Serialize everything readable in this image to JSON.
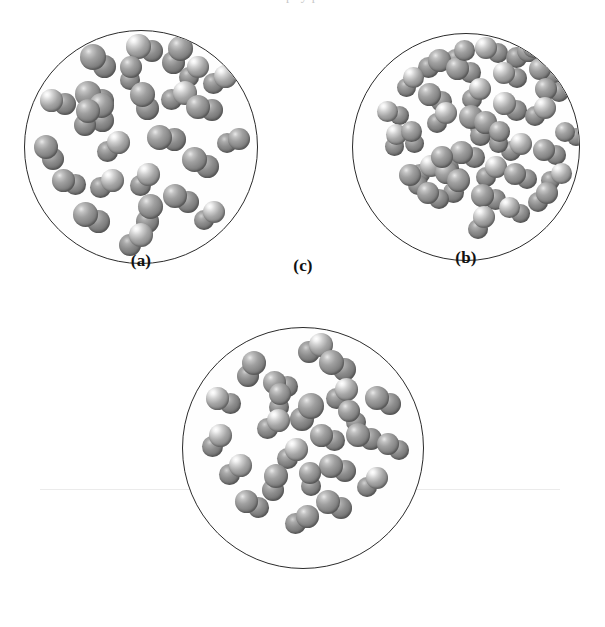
{
  "figure": {
    "background_color": "#ffffff",
    "outline_color": "#2b2b2b",
    "particle_color": "#8a8a8a",
    "particle_highlight_color": "#ffffff",
    "page_bleed_text": "p. y p"
  },
  "panels": [
    {
      "id": "panel-a",
      "label": "(a)",
      "molecule_count": 26,
      "geometry": {
        "cx": 141,
        "cy": 147,
        "r": 117
      },
      "label_pos": {
        "x": 141,
        "y": 281
      },
      "molecules": [
        {
          "x": 0.515,
          "y": 0.075,
          "a": 18,
          "r1": 12.5,
          "r2": 11.0,
          "hl": 1
        },
        {
          "x": 0.315,
          "y": 0.13,
          "a": 40,
          "r1": 13.0,
          "r2": 11.5,
          "hl": 0
        },
        {
          "x": 0.65,
          "y": 0.105,
          "a": 115,
          "r1": 12.5,
          "r2": 11.5,
          "hl": 0
        },
        {
          "x": 0.832,
          "y": 0.21,
          "a": 150,
          "r1": 11.5,
          "r2": 10.5,
          "hl": 1
        },
        {
          "x": 0.142,
          "y": 0.305,
          "a": 12,
          "r1": 11.5,
          "r2": 11.0,
          "hl": 1
        },
        {
          "x": 0.3,
          "y": 0.285,
          "a": 28,
          "r1": 13.0,
          "r2": 12.0,
          "hl": 0
        },
        {
          "x": 0.33,
          "y": 0.35,
          "a": 85,
          "r1": 12.5,
          "r2": 11.5,
          "hl": 0
        },
        {
          "x": 0.512,
          "y": 0.3,
          "a": 70,
          "r1": 12.5,
          "r2": 11.5,
          "hl": 0
        },
        {
          "x": 0.655,
          "y": 0.278,
          "a": 155,
          "r1": 12.0,
          "r2": 10.5,
          "hl": 1
        },
        {
          "x": 0.77,
          "y": 0.33,
          "a": 12,
          "r1": 12.0,
          "r2": 11.0,
          "hl": 0
        },
        {
          "x": 0.608,
          "y": 0.46,
          "a": 8,
          "r1": 12.5,
          "r2": 11.5,
          "hl": 0
        },
        {
          "x": 0.375,
          "y": 0.495,
          "a": 142,
          "r1": 11.5,
          "r2": 10.5,
          "hl": 1
        },
        {
          "x": 0.105,
          "y": 0.52,
          "a": 58,
          "r1": 12.0,
          "r2": 11.0,
          "hl": 0
        },
        {
          "x": 0.888,
          "y": 0.47,
          "a": 165,
          "r1": 11.0,
          "r2": 10.0,
          "hl": 0
        },
        {
          "x": 0.752,
          "y": 0.565,
          "a": 28,
          "r1": 12.5,
          "r2": 11.5,
          "hl": 0
        },
        {
          "x": 0.19,
          "y": 0.648,
          "a": 20,
          "r1": 11.5,
          "r2": 10.5,
          "hl": 0
        },
        {
          "x": 0.348,
          "y": 0.655,
          "a": 150,
          "r1": 11.5,
          "r2": 10.5,
          "hl": 1
        },
        {
          "x": 0.51,
          "y": 0.638,
          "a": 128,
          "r1": 11.5,
          "r2": 10.5,
          "hl": 1
        },
        {
          "x": 0.668,
          "y": 0.718,
          "a": 25,
          "r1": 12.0,
          "r2": 11.0,
          "hl": 0
        },
        {
          "x": 0.785,
          "y": 0.79,
          "a": 140,
          "r1": 11.0,
          "r2": 10.0,
          "hl": 1
        },
        {
          "x": 0.53,
          "y": 0.782,
          "a": 105,
          "r1": 12.5,
          "r2": 11.5,
          "hl": 0
        },
        {
          "x": 0.285,
          "y": 0.8,
          "a": 28,
          "r1": 12.5,
          "r2": 11.5,
          "hl": 0
        },
        {
          "x": 0.472,
          "y": 0.892,
          "a": 138,
          "r1": 12.0,
          "r2": 11.0,
          "hl": 1
        },
        {
          "x": 0.262,
          "y": 0.372,
          "a": 100,
          "r1": 12.0,
          "r2": 11.0,
          "hl": 0
        },
        {
          "x": 0.452,
          "y": 0.18,
          "a": 95,
          "r1": 11.0,
          "r2": 10.0,
          "hl": 0
        },
        {
          "x": 0.72,
          "y": 0.175,
          "a": 135,
          "r1": 11.0,
          "r2": 10.0,
          "hl": 1
        }
      ]
    },
    {
      "id": "panel-b",
      "label": "(b)",
      "molecule_count": 38,
      "geometry": {
        "cx": 466,
        "cy": 147,
        "r": 114
      },
      "label_pos": {
        "x": 466,
        "y": 281
      },
      "molecules": [
        {
          "x": 0.608,
          "y": 0.072,
          "a": 20,
          "r1": 11.0,
          "r2": 10.0,
          "hl": 1
        },
        {
          "x": 0.745,
          "y": 0.088,
          "a": 150,
          "r1": 11.5,
          "r2": 10.5,
          "hl": 0
        },
        {
          "x": 0.355,
          "y": 0.13,
          "a": 150,
          "r1": 11.5,
          "r2": 10.5,
          "hl": 0
        },
        {
          "x": 0.485,
          "y": 0.16,
          "a": 15,
          "r1": 11.5,
          "r2": 10.5,
          "hl": 0
        },
        {
          "x": 0.69,
          "y": 0.182,
          "a": 18,
          "r1": 11.0,
          "r2": 10.0,
          "hl": 1
        },
        {
          "x": 0.845,
          "y": 0.165,
          "a": 28,
          "r1": 11.0,
          "r2": 10.0,
          "hl": 0
        },
        {
          "x": 0.25,
          "y": 0.212,
          "a": 128,
          "r1": 10.5,
          "r2": 9.5,
          "hl": 1
        },
        {
          "x": 0.875,
          "y": 0.248,
          "a": 15,
          "r1": 11.0,
          "r2": 10.0,
          "hl": 0
        },
        {
          "x": 0.36,
          "y": 0.28,
          "a": 30,
          "r1": 11.5,
          "r2": 10.5,
          "hl": 0
        },
        {
          "x": 0.54,
          "y": 0.265,
          "a": 130,
          "r1": 11.0,
          "r2": 10.0,
          "hl": 1
        },
        {
          "x": 0.69,
          "y": 0.32,
          "a": 28,
          "r1": 11.5,
          "r2": 10.5,
          "hl": 1
        },
        {
          "x": 0.82,
          "y": 0.342,
          "a": 145,
          "r1": 11.0,
          "r2": 10.0,
          "hl": 1
        },
        {
          "x": 0.178,
          "y": 0.35,
          "a": 18,
          "r1": 10.5,
          "r2": 9.5,
          "hl": 1
        },
        {
          "x": 0.388,
          "y": 0.368,
          "a": 135,
          "r1": 11.0,
          "r2": 10.0,
          "hl": 1
        },
        {
          "x": 0.54,
          "y": 0.385,
          "a": 42,
          "r1": 12.0,
          "r2": 11.0,
          "hl": 0
        },
        {
          "x": 0.57,
          "y": 0.418,
          "a": 110,
          "r1": 11.5,
          "r2": 10.5,
          "hl": 0
        },
        {
          "x": 0.188,
          "y": 0.468,
          "a": 100,
          "r1": 10.5,
          "r2": 9.5,
          "hl": 1
        },
        {
          "x": 0.715,
          "y": 0.498,
          "a": 145,
          "r1": 11.0,
          "r2": 10.0,
          "hl": 1
        },
        {
          "x": 0.955,
          "y": 0.44,
          "a": 25,
          "r1": 10.0,
          "r2": 9.0,
          "hl": 0
        },
        {
          "x": 0.862,
          "y": 0.518,
          "a": 22,
          "r1": 11.0,
          "r2": 10.0,
          "hl": 0
        },
        {
          "x": 0.505,
          "y": 0.53,
          "a": 20,
          "r1": 11.5,
          "r2": 10.5,
          "hl": 0
        },
        {
          "x": 0.318,
          "y": 0.598,
          "a": 142,
          "r1": 11.0,
          "r2": 10.0,
          "hl": 1
        },
        {
          "x": 0.435,
          "y": 0.62,
          "a": 25,
          "r1": 11.5,
          "r2": 10.5,
          "hl": 0
        },
        {
          "x": 0.452,
          "y": 0.668,
          "a": 115,
          "r1": 11.5,
          "r2": 10.5,
          "hl": 0
        },
        {
          "x": 0.605,
          "y": 0.605,
          "a": 135,
          "r1": 11.0,
          "r2": 10.0,
          "hl": 1
        },
        {
          "x": 0.738,
          "y": 0.625,
          "a": 20,
          "r1": 11.0,
          "r2": 10.0,
          "hl": 0
        },
        {
          "x": 0.89,
          "y": 0.628,
          "a": 148,
          "r1": 10.5,
          "r2": 9.5,
          "hl": 1
        },
        {
          "x": 0.352,
          "y": 0.712,
          "a": 28,
          "r1": 11.0,
          "r2": 10.0,
          "hl": 0
        },
        {
          "x": 0.595,
          "y": 0.718,
          "a": 18,
          "r1": 11.5,
          "r2": 10.5,
          "hl": 0
        },
        {
          "x": 0.832,
          "y": 0.718,
          "a": 135,
          "r1": 11.0,
          "r2": 10.0,
          "hl": 0
        },
        {
          "x": 0.712,
          "y": 0.775,
          "a": 30,
          "r1": 10.5,
          "r2": 9.5,
          "hl": 1
        },
        {
          "x": 0.56,
          "y": 0.828,
          "a": 118,
          "r1": 11.0,
          "r2": 10.0,
          "hl": 1
        },
        {
          "x": 0.47,
          "y": 0.092,
          "a": 140,
          "r1": 10.5,
          "r2": 9.5,
          "hl": 0
        },
        {
          "x": 0.818,
          "y": 0.072,
          "a": 25,
          "r1": 10.5,
          "r2": 9.5,
          "hl": 0
        },
        {
          "x": 0.268,
          "y": 0.64,
          "a": 50,
          "r1": 11.0,
          "r2": 10.0,
          "hl": 0
        },
        {
          "x": 0.405,
          "y": 0.565,
          "a": 60,
          "r1": 11.0,
          "r2": 10.0,
          "hl": 0
        },
        {
          "x": 0.64,
          "y": 0.455,
          "a": 95,
          "r1": 10.5,
          "r2": 9.5,
          "hl": 0
        },
        {
          "x": 0.262,
          "y": 0.455,
          "a": 75,
          "r1": 10.5,
          "r2": 9.5,
          "hl": 0
        }
      ]
    },
    {
      "id": "panel-c",
      "label": "(c)",
      "molecule_count": 24,
      "geometry": {
        "cx": 303,
        "cy": 448,
        "r": 121
      },
      "label_pos": {
        "x": 303,
        "y": 583
      },
      "molecules": [
        {
          "x": 0.545,
          "y": 0.085,
          "a": 150,
          "r1": 12.0,
          "r2": 11.0,
          "hl": 1
        },
        {
          "x": 0.64,
          "y": 0.155,
          "a": 28,
          "r1": 12.5,
          "r2": 11.5,
          "hl": 0
        },
        {
          "x": 0.282,
          "y": 0.17,
          "a": 115,
          "r1": 12.0,
          "r2": 11.0,
          "hl": 0
        },
        {
          "x": 0.405,
          "y": 0.235,
          "a": 18,
          "r1": 11.5,
          "r2": 10.5,
          "hl": 0
        },
        {
          "x": 0.655,
          "y": 0.272,
          "a": 140,
          "r1": 11.5,
          "r2": 10.5,
          "hl": 1
        },
        {
          "x": 0.17,
          "y": 0.3,
          "a": 22,
          "r1": 11.5,
          "r2": 10.5,
          "hl": 1
        },
        {
          "x": 0.83,
          "y": 0.3,
          "a": 25,
          "r1": 12.0,
          "r2": 11.0,
          "hl": 0
        },
        {
          "x": 0.51,
          "y": 0.35,
          "a": 125,
          "r1": 13.0,
          "r2": 12.0,
          "hl": 0
        },
        {
          "x": 0.372,
          "y": 0.4,
          "a": 145,
          "r1": 11.5,
          "r2": 10.5,
          "hl": 1
        },
        {
          "x": 0.6,
          "y": 0.455,
          "a": 20,
          "r1": 11.5,
          "r2": 10.5,
          "hl": 0
        },
        {
          "x": 0.75,
          "y": 0.45,
          "a": 18,
          "r1": 12.0,
          "r2": 11.0,
          "hl": 0
        },
        {
          "x": 0.138,
          "y": 0.468,
          "a": 125,
          "r1": 11.5,
          "r2": 10.5,
          "hl": 1
        },
        {
          "x": 0.87,
          "y": 0.492,
          "a": 30,
          "r1": 11.0,
          "r2": 10.0,
          "hl": 0
        },
        {
          "x": 0.45,
          "y": 0.52,
          "a": 135,
          "r1": 11.5,
          "r2": 10.5,
          "hl": 1
        },
        {
          "x": 0.215,
          "y": 0.588,
          "a": 140,
          "r1": 11.5,
          "r2": 10.5,
          "hl": 1
        },
        {
          "x": 0.64,
          "y": 0.582,
          "a": 20,
          "r1": 12.0,
          "r2": 11.0,
          "hl": 0
        },
        {
          "x": 0.378,
          "y": 0.64,
          "a": 105,
          "r1": 12.0,
          "r2": 11.0,
          "hl": 0
        },
        {
          "x": 0.782,
          "y": 0.638,
          "a": 138,
          "r1": 11.0,
          "r2": 10.0,
          "hl": 1
        },
        {
          "x": 0.288,
          "y": 0.73,
          "a": 28,
          "r1": 11.5,
          "r2": 10.5,
          "hl": 0
        },
        {
          "x": 0.625,
          "y": 0.73,
          "a": 25,
          "r1": 12.0,
          "r2": 11.0,
          "hl": 0
        },
        {
          "x": 0.49,
          "y": 0.792,
          "a": 150,
          "r1": 11.5,
          "r2": 10.5,
          "hl": 0
        },
        {
          "x": 0.398,
          "y": 0.3,
          "a": 95,
          "r1": 11.0,
          "r2": 10.0,
          "hl": 0
        },
        {
          "x": 0.528,
          "y": 0.628,
          "a": 85,
          "r1": 11.0,
          "r2": 10.0,
          "hl": 0
        },
        {
          "x": 0.7,
          "y": 0.365,
          "a": 60,
          "r1": 11.0,
          "r2": 10.0,
          "hl": 0
        }
      ]
    }
  ]
}
